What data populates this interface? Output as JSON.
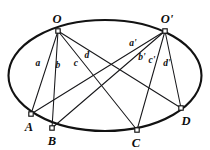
{
  "figure": {
    "kind": "geometry-diagram",
    "background_color": "#ffffff",
    "ink_color": "#121212",
    "canvas": {
      "width": 210,
      "height": 150
    },
    "conic": {
      "shape": "ellipse",
      "center_x": 105,
      "center_y": 75.5,
      "radius_x": 96.5,
      "radius_y": 55.5
    },
    "vertices": [
      {
        "id": "O",
        "label": "O",
        "x": 58,
        "y": 31,
        "label_x": 57,
        "label_y": 19
      },
      {
        "id": "Op",
        "label": "O'",
        "x": 165,
        "y": 31,
        "label_x": 167,
        "label_y": 19
      },
      {
        "id": "A",
        "label": "A",
        "x": 31,
        "y": 114,
        "label_x": 29,
        "label_y": 127
      },
      {
        "id": "B",
        "label": "B",
        "x": 52,
        "y": 128,
        "label_x": 52,
        "label_y": 141
      },
      {
        "id": "C",
        "label": "C",
        "x": 137,
        "y": 130,
        "label_x": 136,
        "label_y": 143
      },
      {
        "id": "D",
        "label": "D",
        "x": 181,
        "y": 108,
        "label_x": 186,
        "label_y": 121
      }
    ],
    "chords": [
      {
        "id": "OA",
        "from": "O",
        "to": "A"
      },
      {
        "id": "OB",
        "from": "O",
        "to": "B"
      },
      {
        "id": "OC",
        "from": "O",
        "to": "C"
      },
      {
        "id": "OD",
        "from": "O",
        "to": "D"
      },
      {
        "id": "OpA",
        "from": "Op",
        "to": "A"
      },
      {
        "id": "OpB",
        "from": "Op",
        "to": "B"
      },
      {
        "id": "OpC",
        "from": "Op",
        "to": "C"
      },
      {
        "id": "OpD",
        "from": "Op",
        "to": "D"
      }
    ],
    "segment_labels": [
      {
        "id": "a",
        "text": "a",
        "x": 38,
        "y": 64
      },
      {
        "id": "b",
        "text": "b",
        "x": 58,
        "y": 66
      },
      {
        "id": "c",
        "text": "c",
        "x": 76,
        "y": 64
      },
      {
        "id": "d",
        "text": "d",
        "x": 87,
        "y": 56
      },
      {
        "id": "ap",
        "text": "a'",
        "x": 133,
        "y": 44
      },
      {
        "id": "bp",
        "text": "b'",
        "x": 142,
        "y": 58
      },
      {
        "id": "cp",
        "text": "c'",
        "x": 152,
        "y": 61
      },
      {
        "id": "dp",
        "text": "d'",
        "x": 167,
        "y": 64
      }
    ]
  }
}
